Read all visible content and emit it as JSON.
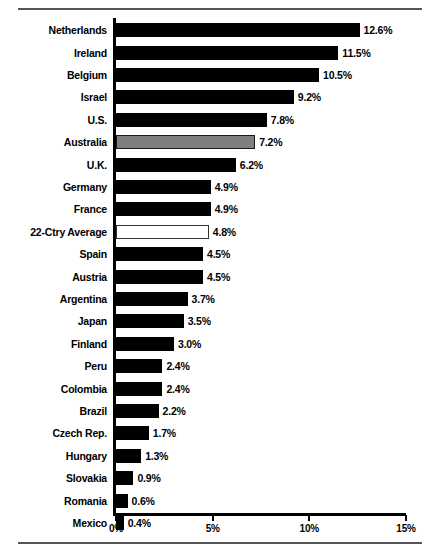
{
  "chart_data": {
    "type": "bar",
    "orientation": "horizontal",
    "title": "",
    "subtitle": "",
    "xlabel": "",
    "ylabel": "",
    "xlim": [
      0,
      15
    ],
    "grid": false,
    "legend": null,
    "axis_tick_labels": [
      "0%",
      "5%",
      "10%",
      "15%"
    ],
    "axis_tick_values": [
      0,
      5,
      10,
      15
    ],
    "value_suffix": "%",
    "categories": [
      "Netherlands",
      "Ireland",
      "Belgium",
      "Israel",
      "U.S.",
      "Australia",
      "U.K.",
      "Germany",
      "France",
      "22-Ctry Average",
      "Spain",
      "Austria",
      "Argentina",
      "Japan",
      "Finland",
      "Peru",
      "Colombia",
      "Brazil",
      "Czech Rep.",
      "Hungary",
      "Slovakia",
      "Romania",
      "Mexico"
    ],
    "values": [
      12.6,
      11.5,
      10.5,
      9.2,
      7.8,
      7.2,
      6.2,
      4.9,
      4.9,
      4.8,
      4.5,
      4.5,
      3.7,
      3.5,
      3.0,
      2.4,
      2.4,
      2.2,
      1.7,
      1.3,
      0.9,
      0.6,
      0.4
    ],
    "data_labels": [
      "12.6%",
      "11.5%",
      "10.5%",
      "9.2%",
      "7.8%",
      "7.2%",
      "6.2%",
      "4.9%",
      "4.9%",
      "4.8%",
      "4.5%",
      "4.5%",
      "3.7%",
      "3.5%",
      "3.0%",
      "2.4%",
      "2.4%",
      "2.2%",
      "1.7%",
      "1.3%",
      "0.9%",
      "0.6%",
      "0.4%"
    ],
    "bar_styles": [
      "solid",
      "solid",
      "solid",
      "solid",
      "solid",
      "gray",
      "solid",
      "solid",
      "solid",
      "hollow",
      "solid",
      "solid",
      "solid",
      "solid",
      "solid",
      "solid",
      "solid",
      "solid",
      "solid",
      "solid",
      "solid",
      "solid",
      "solid"
    ],
    "colors": {
      "bar_solid": "#000000",
      "bar_highlight": "#7f7f7f",
      "bar_average": "#ffffff",
      "axis": "#000000",
      "rule": "#555555",
      "text": "#000000",
      "background": "#ffffff"
    }
  }
}
